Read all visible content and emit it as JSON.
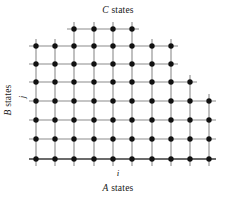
{
  "figure": {
    "title_top": "C states",
    "title_bottom": "A states",
    "title_left": "B states",
    "axis_x_symbol": "i",
    "axis_y_symbol": "j",
    "background_color": "#ffffff",
    "node_color": "#111111",
    "edge_color": "#8c8c8c",
    "baseline_color": "#3a3a3a"
  },
  "chart_data": {
    "type": "scatter",
    "title": "C states",
    "xlabel": "i",
    "ylabel": "j",
    "x_axis_group": "A states",
    "y_axis_group": "B states",
    "top_axis_group": "C states",
    "grid": true,
    "legend": "none",
    "x_spacing": 19.3,
    "y_spacing": 18.5,
    "x_origin": 36,
    "y_origin": 159,
    "columns": 10,
    "rows": 8,
    "row_node_counts": [
      4,
      8,
      8,
      9,
      10,
      10,
      10,
      10
    ],
    "rows_detail": [
      {
        "j": 7,
        "y": 29,
        "col_start": 2,
        "col_end": 5,
        "count": 4
      },
      {
        "j": 6,
        "y": 46,
        "col_start": 0,
        "col_end": 7,
        "count": 8
      },
      {
        "j": 5,
        "y": 64,
        "col_start": 0,
        "col_end": 7,
        "count": 8
      },
      {
        "j": 4,
        "y": 82,
        "col_start": 0,
        "col_end": 8,
        "count": 9
      },
      {
        "j": 3,
        "y": 101,
        "col_start": 0,
        "col_end": 9,
        "count": 10
      },
      {
        "j": 2,
        "y": 120,
        "col_start": 0,
        "col_end": 9,
        "count": 10
      },
      {
        "j": 1,
        "y": 139,
        "col_start": 0,
        "col_end": 9,
        "count": 10
      },
      {
        "j": 0,
        "y": 159,
        "col_start": 0,
        "col_end": 9,
        "count": 10
      }
    ],
    "column_x": [
      36,
      55,
      74,
      94,
      113,
      132,
      152,
      171,
      190,
      209
    ],
    "total_nodes": 69
  }
}
